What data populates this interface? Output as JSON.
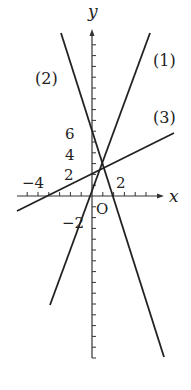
{
  "chart_data": {
    "type": "line",
    "title": "",
    "xlabel": "x",
    "ylabel": "y",
    "origin_label": "O",
    "xlim": [
      -7,
      6.5
    ],
    "ylim": [
      -15,
      15
    ],
    "grid": false,
    "legend": "inline labels",
    "x_tick_labels": [
      {
        "value": -4,
        "label": "−4"
      },
      {
        "value": 2,
        "label": "2"
      }
    ],
    "y_tick_labels": [
      {
        "value": 6,
        "label": "6"
      },
      {
        "value": 4,
        "label": "4"
      },
      {
        "value": 2,
        "label": "2"
      },
      {
        "value": -2,
        "label": "−2"
      }
    ],
    "series": [
      {
        "name": "(1)",
        "label": "(1)",
        "equation": "y = 2x + 4",
        "slope": 2,
        "intercept": 4,
        "x": [
          -4,
          5.4
        ],
        "y": [
          -4,
          14.8
        ]
      },
      {
        "name": "(2)",
        "label": "(2)",
        "equation": "y = -3x + 5",
        "slope": -3,
        "intercept": 5,
        "x": [
          -2.9,
          6.6
        ],
        "y": [
          13.7,
          -14.8
        ]
      },
      {
        "name": "(3)",
        "label": "(3)",
        "equation": "y = x/2 + 5/2",
        "slope": 0.5,
        "intercept": 2.5,
        "x": [
          -7,
          7.7
        ],
        "y": [
          -1,
          6.4
        ]
      }
    ]
  },
  "labels": {
    "y_axis": "y",
    "x_axis": "x",
    "origin": "O",
    "line1": "(1)",
    "line2": "(2)",
    "line3": "(3)",
    "y6": "6",
    "y4": "4",
    "y2": "2",
    "yneg2": "−2",
    "xneg4": "−4",
    "x2": "2"
  },
  "colors": {
    "line": "#222222",
    "axis": "#333333",
    "background": "#ffffff"
  }
}
